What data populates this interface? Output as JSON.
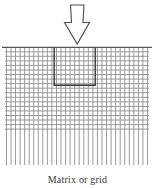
{
  "figure": {
    "caption": "Matrix or grid",
    "arrow": {
      "name": "down-arrow-icon",
      "direction": "down",
      "fill": "#ffffff",
      "stroke": "#4a4a4a"
    },
    "grid": {
      "line_color": "#888888",
      "top_rule_color": "#555555",
      "left": 6,
      "right": 148,
      "top": 47,
      "vertical_bottom": 165,
      "horizontal_bottom": 129,
      "spacing": 4.55,
      "vertical_count": 32,
      "horizontal_count": 19
    },
    "highlight_rect": {
      "name": "selected-cell-block",
      "color": "#333333",
      "x": 54,
      "y": 48,
      "width": 41,
      "height": 37
    }
  }
}
